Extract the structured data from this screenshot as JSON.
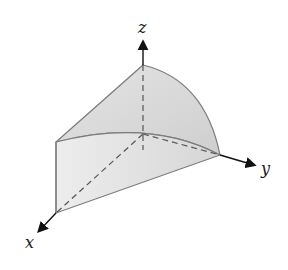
{
  "figure": {
    "type": "3d-solid-diagram",
    "axes": {
      "x_label": "x",
      "y_label": "y",
      "z_label": "z"
    },
    "colors": {
      "fill": "#d9d9d9",
      "fill_light": "#ececec",
      "edge": "#7a7a7a",
      "axis": "#111111",
      "dashed": "#555555"
    }
  }
}
